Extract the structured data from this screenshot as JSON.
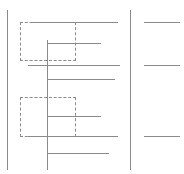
{
  "diagram": {
    "type": "ladder-wireframe",
    "stroke_color": "#8a8a8a",
    "background": "#ffffff",
    "vertical_rails": [
      {
        "name": "left-rail",
        "x": 7,
        "y1": 10,
        "y2": 170
      },
      {
        "name": "center-rail",
        "x": 47,
        "y1": 40,
        "y2": 170
      },
      {
        "name": "right-rail",
        "x": 130,
        "y1": 10,
        "y2": 170
      }
    ],
    "dashed_boxes": [
      {
        "name": "group-box-1",
        "x": 20,
        "y": 22,
        "w": 56,
        "h": 39
      },
      {
        "name": "group-box-2",
        "x": 20,
        "y": 97,
        "w": 56,
        "h": 40
      }
    ],
    "horizontal_lines": [
      {
        "name": "rung-1",
        "x1": 30,
        "x2": 118,
        "y": 22
      },
      {
        "name": "rung-2",
        "x1": 48,
        "x2": 101,
        "y": 43
      },
      {
        "name": "rung-3",
        "x1": 28,
        "x2": 120,
        "y": 65
      },
      {
        "name": "rung-4",
        "x1": 47,
        "x2": 115,
        "y": 79
      },
      {
        "name": "rung-5",
        "x1": 48,
        "x2": 101,
        "y": 116
      },
      {
        "name": "rung-6",
        "x1": 28,
        "x2": 118,
        "y": 136
      },
      {
        "name": "rung-7",
        "x1": 47,
        "x2": 109,
        "y": 153
      }
    ],
    "right_lines": [
      {
        "name": "right-line-1",
        "x1": 144,
        "x2": 180,
        "y": 22
      },
      {
        "name": "right-line-2",
        "x1": 144,
        "x2": 180,
        "y": 65
      },
      {
        "name": "right-line-3",
        "x1": 144,
        "x2": 180,
        "y": 136
      }
    ]
  }
}
